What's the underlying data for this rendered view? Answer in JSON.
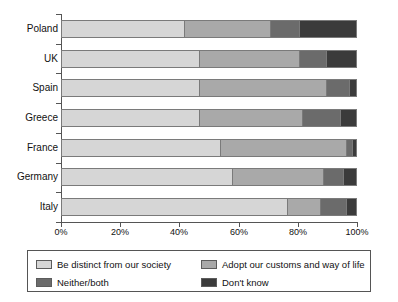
{
  "chart_data": {
    "type": "bar",
    "orientation": "horizontal",
    "stacked": true,
    "normalized_percent": true,
    "title": "",
    "subtitle": "",
    "xlabel": "",
    "ylabel": "",
    "xlim": [
      0,
      100
    ],
    "xticks": [
      0,
      20,
      40,
      60,
      80,
      100
    ],
    "xtick_labels": [
      "0%",
      "20%",
      "40%",
      "60%",
      "80%",
      "100%"
    ],
    "grid": false,
    "legend_position": "bottom",
    "categories": [
      "Poland",
      "UK",
      "Spain",
      "Greece",
      "France",
      "Germany",
      "Italy"
    ],
    "series": [
      {
        "name": "Be distinct from our society",
        "color": "#d6d6d6",
        "values": [
          42,
          47,
          47,
          47,
          54,
          58,
          77
        ]
      },
      {
        "name": "Adopt our customs and way of life",
        "color": "#a9a9a9",
        "values": [
          29,
          34,
          43,
          35,
          43,
          31,
          11
        ]
      },
      {
        "name": "Neither/both",
        "color": "#6b6b6b",
        "values": [
          10,
          9,
          8,
          13,
          2,
          7,
          9
        ]
      },
      {
        "name": "Don't know",
        "color": "#3b3b3b",
        "values": [
          19,
          10,
          2,
          5,
          1,
          4,
          3
        ]
      }
    ]
  },
  "legend": {
    "items": [
      {
        "label": "Be distinct from our society",
        "color": "#d6d6d6"
      },
      {
        "label": "Adopt our customs and way of life",
        "color": "#a9a9a9"
      },
      {
        "label": "Neither/both",
        "color": "#6b6b6b"
      },
      {
        "label": "Don't know",
        "color": "#3b3b3b"
      }
    ]
  }
}
